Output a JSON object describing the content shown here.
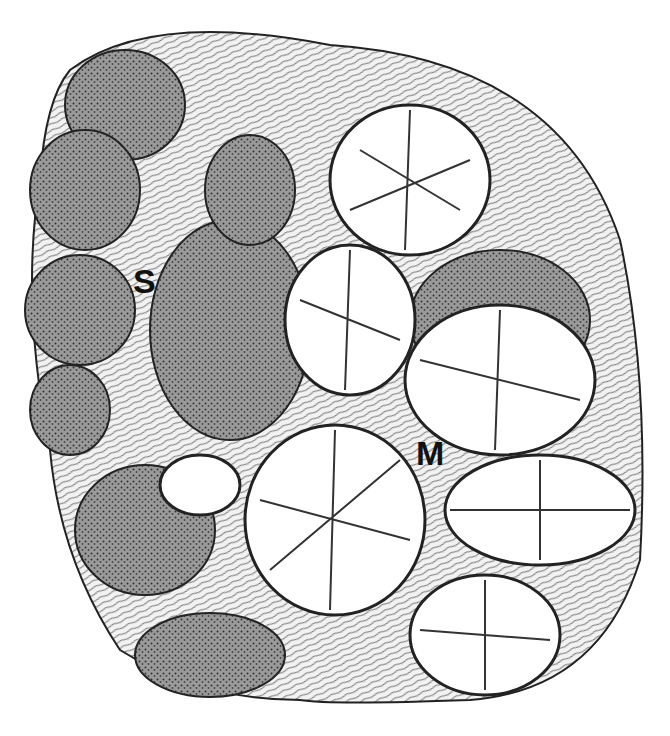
{
  "figure": {
    "colors": {
      "ink": "#111111",
      "paper": "#ffffff",
      "stroma": "#f4f4f4"
    },
    "labels": [
      {
        "text": "S",
        "meaning": "serous acini"
      },
      {
        "text": "M",
        "meaning": "mucous acini"
      }
    ]
  }
}
